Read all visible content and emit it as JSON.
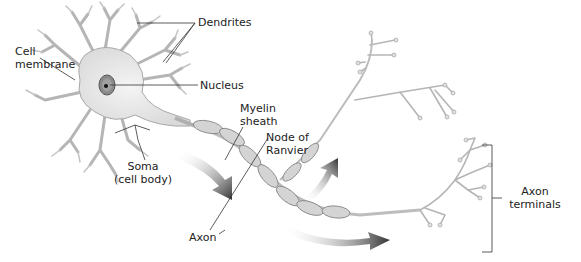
{
  "diagram": {
    "labels": {
      "dendrites": "Dendrites",
      "cell_membrane_l1": "Cell",
      "cell_membrane_l2": "membrane",
      "nucleus": "Nucleus",
      "myelin_l1": "Myelin",
      "myelin_l2": "sheath",
      "node_l1": "Node of",
      "node_l2": "Ranvier",
      "soma_l1": "Soma",
      "soma_l2": "(cell body)",
      "axon": "Axon",
      "terminals_l1": "Axon",
      "terminals_l2": "terminals"
    },
    "colors": {
      "cell_fill": "#e6e6e6",
      "cell_stroke": "#9a9a9a",
      "myelin_fill": "#d2d2d2",
      "myelin_stroke": "#7a7a7a",
      "arrow": "#3a3a3a",
      "leader": "#333333",
      "nucleus": "#6a6a6a"
    }
  }
}
